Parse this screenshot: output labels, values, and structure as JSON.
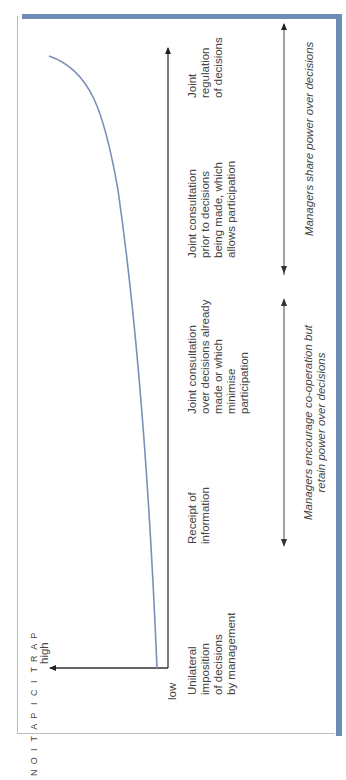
{
  "figure": {
    "orientation": "rotated 90° counter-clockwise",
    "y_axis": {
      "title_letters": [
        "P",
        "A",
        "R",
        "T",
        "I",
        "C",
        "I",
        "P",
        "A",
        "T",
        "I",
        "O",
        "N"
      ],
      "title": "PARTICIPATION",
      "high_label": "high",
      "low_label": "low"
    },
    "stages": [
      {
        "id": "unilateral",
        "lines": [
          "Unilateral",
          "imposition",
          "of decisions",
          "by management"
        ]
      },
      {
        "id": "receipt",
        "lines": [
          "Receipt of",
          "information"
        ]
      },
      {
        "id": "consult-after",
        "lines": [
          "Joint consultation",
          "over decisions already",
          "made or which",
          "minimise",
          "participation"
        ]
      },
      {
        "id": "consult-before",
        "lines": [
          "Joint consultation",
          "prior to decisions",
          "being made, which",
          "allows participation"
        ]
      },
      {
        "id": "joint-regulation",
        "lines": [
          "Joint",
          "regulation",
          "of decisions"
        ]
      }
    ],
    "ranges": [
      {
        "id": "retain-power",
        "lines": [
          "Managers encourage co-operation but",
          "retain power over decisions"
        ]
      },
      {
        "id": "share-power",
        "lines": [
          "Managers share power over decisions"
        ]
      }
    ],
    "colors": {
      "curve": "#7a8fb8",
      "frame_accent": "#6f8bb8",
      "axis": "#333333"
    }
  }
}
